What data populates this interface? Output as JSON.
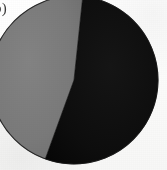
{
  "figure": {
    "subfigure_label": "b)",
    "background_color": "#fcfcfc",
    "width": 167,
    "height": 170
  },
  "chart_data": {
    "type": "pie",
    "title": "",
    "subtitle": "",
    "xlabel": "",
    "ylabel": "",
    "labels": [
      "Segment 1",
      "Segment 2"
    ],
    "values": [
      46,
      54
    ],
    "colors": [
      "#7a7a7a",
      "#0d0d0d"
    ],
    "legend": [],
    "legend_position": "none",
    "grid": false,
    "annotations": [],
    "geometry": {
      "center_x": 74,
      "center_y": 80,
      "radius": 84,
      "start_angle_deg": 6,
      "gray_sweep_deg": 166,
      "black_sweep_deg": 194
    }
  },
  "styles": {
    "gray_slice_color": "#7a7a7a",
    "black_slice_color": "#0d0d0d",
    "outline_color": "#141414",
    "label_color": "#20201f"
  }
}
